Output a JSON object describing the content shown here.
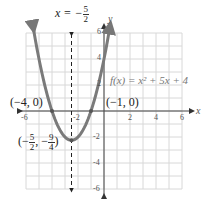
{
  "chart_data": {
    "type": "line",
    "title": "",
    "function_label": "f(x) = x² + 5x + 4",
    "xlabel": "x",
    "ylabel": "y",
    "xlim": [
      -6,
      6
    ],
    "ylim": [
      -6,
      6
    ],
    "grid": true,
    "x_ticks": [
      "-6",
      "-2",
      "2",
      "4",
      "6"
    ],
    "y_ticks": [
      "6",
      "4",
      "2",
      "-2",
      "-4",
      "-6"
    ],
    "series": [
      {
        "name": "f(x) = x^2 + 5x + 4",
        "x": [
          -5.4,
          -5,
          -4,
          -3,
          -2.5,
          -2,
          -1,
          0,
          0.4
        ],
        "values": [
          6.16,
          4,
          0,
          -2,
          -2.25,
          -2,
          0,
          4,
          6.16
        ]
      }
    ],
    "axis_of_symmetry": {
      "label_prefix": "x = −",
      "num": "5",
      "den": "2",
      "x": -2.5
    },
    "annotations": [
      {
        "text": "(−4, 0)",
        "x": -4,
        "y": 0
      },
      {
        "text": "(−1, 0)",
        "x": -1,
        "y": 0
      },
      {
        "text_prefix": "(−",
        "num1": "5",
        "den1": "2",
        "sep": ", −",
        "num2": "9",
        "den2": "4",
        "suffix": ")",
        "x": -2.5,
        "y": -2.25
      }
    ],
    "colors": {
      "curve": "#7a7a7a",
      "grid": "#d8d8d8",
      "axis": "#444444"
    }
  }
}
